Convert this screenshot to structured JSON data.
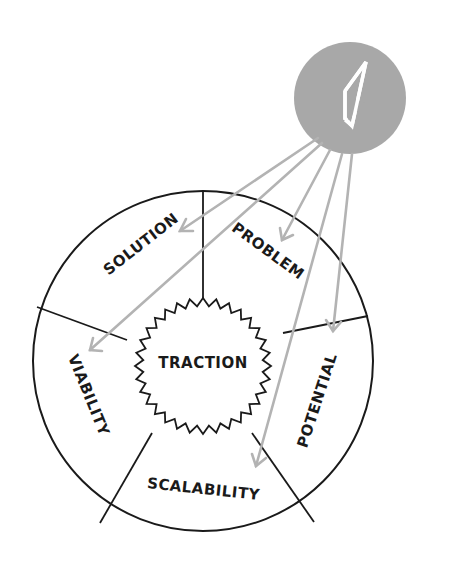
{
  "diagram": {
    "center_label": "TRACTION",
    "segments": [
      {
        "id": "solution",
        "label": "SOLUTION"
      },
      {
        "id": "problem",
        "label": "PROBLEM"
      },
      {
        "id": "potential",
        "label": "POTENTIAL"
      },
      {
        "id": "scalability",
        "label": "SCALABILITY"
      },
      {
        "id": "viability",
        "label": "VIABILITY"
      }
    ],
    "compass_icon": "compass-icon",
    "colors": {
      "line": "#1a1a1a",
      "arrow": "#b3b3b3",
      "compass_fill": "#a8a8a8",
      "compass_needle": "#ffffff"
    }
  }
}
